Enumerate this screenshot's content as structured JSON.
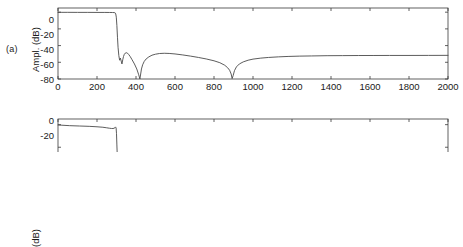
{
  "figure": {
    "background_color": "#ffffff",
    "line_color": "#4a4a4a",
    "axis_color": "#3a3a3a",
    "text_color": "#1a1a1a"
  },
  "panels": [
    {
      "tag": "(a)",
      "ylabel": "Ampl. (dB)",
      "xtick_labels": [
        "0",
        "200",
        "400",
        "600",
        "800",
        "1000",
        "1200",
        "1400",
        "1600",
        "1800",
        "2000"
      ],
      "ytick_labels": [
        "0",
        "-20",
        "-40",
        "-60",
        "-80"
      ]
    },
    {
      "tag": "",
      "ylabel": "(dB)",
      "xtick_labels": [],
      "ytick_labels": [
        "0",
        "-20"
      ]
    }
  ],
  "chart_data": [
    {
      "type": "line",
      "title": "",
      "panel": "(a)",
      "xlabel": "",
      "ylabel": "Ampl. (dB)",
      "xlim": [
        0,
        2000
      ],
      "ylim": [
        -80,
        5
      ],
      "xticks": [
        0,
        200,
        400,
        600,
        800,
        1000,
        1200,
        1400,
        1600,
        1800,
        2000
      ],
      "yticks": [
        0,
        -20,
        -40,
        -60,
        -80
      ],
      "grid": false,
      "legend": "none",
      "series": [
        {
          "name": "amplitude-response",
          "x": [
            0,
            20,
            50,
            100,
            150,
            200,
            240,
            265,
            280,
            288,
            293,
            296,
            299,
            302,
            305,
            308,
            312,
            316,
            320,
            324,
            328,
            332,
            336,
            340,
            345,
            350,
            356,
            362,
            370,
            380,
            392,
            404,
            414,
            420,
            424,
            428,
            434,
            442,
            452,
            466,
            482,
            500,
            520,
            545,
            570,
            600,
            640,
            680,
            720,
            760,
            800,
            830,
            855,
            870,
            880,
            888,
            893,
            898,
            905,
            915,
            930,
            950,
            975,
            1000,
            1040,
            1080,
            1130,
            1180,
            1240,
            1300,
            1380,
            1460,
            1540,
            1620,
            1700,
            1800,
            1900,
            2000
          ],
          "y": [
            -0.2,
            -0.2,
            -0.2,
            -0.25,
            -0.25,
            -0.3,
            -0.3,
            -0.35,
            -0.4,
            -0.5,
            -0.8,
            -2.0,
            -6.0,
            -16.0,
            -30.0,
            -42.0,
            -52.0,
            -57.5,
            -55.0,
            -58.5,
            -62.0,
            -57.0,
            -53.0,
            -50.5,
            -49.0,
            -48.5,
            -49.0,
            -50.5,
            -53.0,
            -57.0,
            -62.0,
            -68.0,
            -75.0,
            -80.0,
            -74.0,
            -68.0,
            -63.0,
            -59.0,
            -56.0,
            -53.5,
            -51.5,
            -50.3,
            -49.5,
            -49.2,
            -49.4,
            -50.0,
            -51.2,
            -52.6,
            -54.2,
            -56.0,
            -58.2,
            -60.5,
            -63.5,
            -66.5,
            -69.5,
            -74.0,
            -79.5,
            -76.0,
            -70.0,
            -65.5,
            -62.0,
            -59.5,
            -57.5,
            -56.2,
            -55.0,
            -54.2,
            -53.5,
            -53.0,
            -52.6,
            -52.4,
            -52.1,
            -52.0,
            -51.9,
            -51.85,
            -51.8,
            -51.8,
            -51.75,
            -51.7
          ]
        }
      ],
      "annotations": [
        {
          "text": "passband edge",
          "x": 300,
          "y": 0
        },
        {
          "text": "spectral null",
          "x": 420,
          "y": -80
        },
        {
          "text": "spectral null",
          "x": 893,
          "y": -80
        },
        {
          "text": "stopband asymptote",
          "x": 2000,
          "y": -52
        }
      ]
    },
    {
      "type": "line",
      "title": "",
      "panel": "(b-cropped)",
      "xlabel": "",
      "ylabel": "(dB)",
      "xlim": [
        0,
        2000
      ],
      "ylim": [
        -80,
        5
      ],
      "xticks": [
        0,
        200,
        400,
        600,
        800,
        1000,
        1200,
        1400,
        1600,
        1800,
        2000
      ],
      "yticks": [
        0,
        -20
      ],
      "grid": false,
      "legend": "none",
      "note": "lower panel is cut off by the bottom image edge; only the top of the axes is visible",
      "series": [
        {
          "name": "amplitude-response",
          "x": [
            0,
            20,
            60,
            110,
            160,
            200,
            230,
            250,
            265,
            275,
            282,
            288,
            292,
            295,
            298,
            300,
            302,
            305,
            310,
            316,
            322
          ],
          "y": [
            -0.3,
            -0.5,
            -0.9,
            -1.2,
            -1.5,
            -1.9,
            -2.3,
            -2.8,
            -3.2,
            -3.4,
            -3.4,
            -3.2,
            -2.6,
            -2.0,
            -3.0,
            -8.0,
            -18.0,
            -32.0,
            -48.0,
            -62.0,
            -72.0
          ]
        }
      ]
    }
  ]
}
